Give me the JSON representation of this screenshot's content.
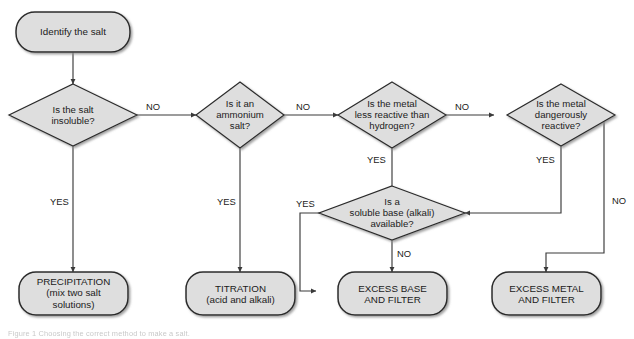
{
  "figure": {
    "caption": "Figure 1  Choosing the correct method to make a salt.",
    "colors": {
      "node_fill": "#dedede",
      "node_stroke": "#2b2b2b",
      "shadow": "#9a9a9a",
      "line": "#3a3a3a",
      "text": "#1b1b1b",
      "background": "#ffffff"
    }
  },
  "nodes": {
    "start": {
      "type": "terminator",
      "label": "Identify the salt"
    },
    "d1": {
      "type": "decision",
      "label": "Is the salt\ninsoluble?"
    },
    "d2": {
      "type": "decision",
      "label": "Is it an\nammonium\nsalt?"
    },
    "d3": {
      "type": "decision",
      "label": "Is the metal\nless reactive than\nhydrogen?"
    },
    "d4": {
      "type": "decision",
      "label": "Is the metal\ndangerously\nreactive?"
    },
    "d5": {
      "type": "decision",
      "label": "Is a\nsoluble base (alkali)\navailable?"
    },
    "r1": {
      "type": "terminator",
      "label": "PRECIPITATION\n(mix two salt\nsolutions)"
    },
    "r2": {
      "type": "terminator",
      "label": "TITRATION\n(acid and alkali)"
    },
    "r3": {
      "type": "terminator",
      "label": "EXCESS BASE\nAND FILTER"
    },
    "r4": {
      "type": "terminator",
      "label": "EXCESS METAL\nAND FILTER"
    }
  },
  "edges": [
    {
      "id": "e-start-d1",
      "from": "start",
      "to": "d1",
      "label": ""
    },
    {
      "id": "e-d1-d2",
      "from": "d1",
      "to": "d2",
      "label": "NO"
    },
    {
      "id": "e-d1-r1",
      "from": "d1",
      "to": "r1",
      "label": "YES"
    },
    {
      "id": "e-d2-d3",
      "from": "d2",
      "to": "d3",
      "label": "NO"
    },
    {
      "id": "e-d2-r2",
      "from": "d2",
      "to": "r2",
      "label": "YES"
    },
    {
      "id": "e-d3-d4",
      "from": "d3",
      "to": "d4",
      "label": "NO"
    },
    {
      "id": "e-d3-d5",
      "from": "d3",
      "to": "d5",
      "label": "YES"
    },
    {
      "id": "e-d4-d5",
      "from": "d4",
      "to": "d5",
      "label": "YES"
    },
    {
      "id": "e-d4-r4",
      "from": "d4",
      "to": "r4",
      "label": "NO"
    },
    {
      "id": "e-d5-r2",
      "from": "d5",
      "to": "r2",
      "label": "YES"
    },
    {
      "id": "e-d5-r3",
      "from": "d5",
      "to": "r3",
      "label": "NO"
    }
  ],
  "edge_labels": {
    "d1_no": "NO",
    "d1_yes": "YES",
    "d2_no": "NO",
    "d2_yes": "YES",
    "d3_no": "NO",
    "d3_yes": "YES",
    "d4_yes": "YES",
    "d4_no": "NO",
    "d5_yes": "YES",
    "d5_no": "NO"
  }
}
